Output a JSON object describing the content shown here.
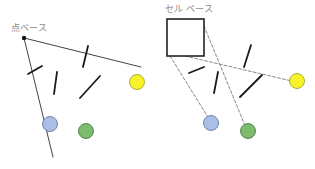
{
  "panels": {
    "left": {
      "label": "点ベース",
      "label_pos": [
        11,
        31
      ],
      "anchor_point": [
        24,
        38
      ],
      "rays": [
        {
          "from": [
            24,
            38
          ],
          "to": [
            141,
            67
          ]
        },
        {
          "from": [
            24,
            38
          ],
          "to": [
            53,
            157
          ]
        }
      ],
      "obstacles": [
        {
          "from": [
            28,
            74
          ],
          "to": [
            42,
            66
          ]
        },
        {
          "from": [
            57,
            72
          ],
          "to": [
            54,
            94
          ]
        },
        {
          "from": [
            88,
            46
          ],
          "to": [
            83,
            67
          ]
        },
        {
          "from": [
            100,
            76
          ],
          "to": [
            80,
            98
          ]
        }
      ],
      "targets": [
        {
          "name": "yellow",
          "cx": 137,
          "cy": 82,
          "r": 7.5,
          "fill": "#f7f22a",
          "stroke": "#9a9a20"
        },
        {
          "name": "blue",
          "cx": 50,
          "cy": 124,
          "r": 7.5,
          "fill": "#a9bfe6",
          "stroke": "#5a6f96"
        },
        {
          "name": "green",
          "cx": 86,
          "cy": 131,
          "r": 7.5,
          "fill": "#7dbb6d",
          "stroke": "#3e6d36"
        }
      ]
    },
    "right": {
      "label": "セル ベース",
      "label_pos": [
        165,
        12
      ],
      "cell": {
        "x": 167,
        "y": 19,
        "w": 37,
        "h": 37
      },
      "rays": [
        {
          "from": [
            170,
            56
          ],
          "to": [
            211,
            122
          ]
        },
        {
          "from": [
            204,
            26
          ],
          "to": [
            246,
            128
          ]
        },
        {
          "from": [
            185,
            56
          ],
          "to": [
            296,
            82
          ]
        }
      ],
      "obstacles": [
        {
          "from": [
            189,
            73
          ],
          "to": [
            204,
            67
          ]
        },
        {
          "from": [
            218,
            72
          ],
          "to": [
            214,
            93
          ]
        },
        {
          "from": [
            251,
            45
          ],
          "to": [
            244,
            67
          ]
        },
        {
          "from": [
            262,
            75
          ],
          "to": [
            240,
            97
          ]
        }
      ],
      "targets": [
        {
          "name": "yellow",
          "cx": 297,
          "cy": 81,
          "r": 7.5,
          "fill": "#f7f22a",
          "stroke": "#9a9a20"
        },
        {
          "name": "blue",
          "cx": 211,
          "cy": 123,
          "r": 7.5,
          "fill": "#a9bfe6",
          "stroke": "#5a6f96"
        },
        {
          "name": "green",
          "cx": 248,
          "cy": 131,
          "r": 7.5,
          "fill": "#7dbb6d",
          "stroke": "#3e6d36"
        }
      ]
    }
  },
  "colors": {
    "ray": "#444444",
    "dashed_ray": "#888888",
    "obstacle": "#1a1a1a",
    "cell_stroke": "#222222",
    "label": "#8a8a8a"
  }
}
